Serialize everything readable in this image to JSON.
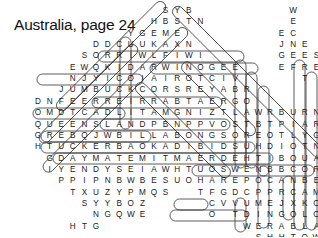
{
  "title": "Australia, page 24",
  "grid": {
    "x0": 38,
    "y0": 10,
    "dx": 11.6,
    "dy": 11.35,
    "rows": [
      {
        "r": 0,
        "c": 11,
        "letters": "SYB"
      },
      {
        "r": 1,
        "c": 10,
        "letters": "HBSTN"
      },
      {
        "r": 2,
        "c": 8,
        "letters": "YGEME"
      },
      {
        "r": 3,
        "c": 5,
        "letters": "DDCUUKAXN"
      },
      {
        "r": 4,
        "c": 4,
        "letters": "SORRIWLFIWI"
      },
      {
        "r": 5,
        "c": 3,
        "letters": "EWQKIDARWINOGEE"
      },
      {
        "r": 6,
        "c": 3,
        "letters": "NJYICOIAIROTCIV"
      },
      {
        "r": 7,
        "c": 2,
        "letters": "JUMBUCKCORSREYABR"
      },
      {
        "r": 8,
        "c": 0,
        "letters": "DNFEERREIRRABTAERGO"
      },
      {
        "r": 9,
        "c": 0,
        "letters": "OMDTCADLITAMGNIZTLAWRBURN"
      },
      {
        "r": 10,
        "c": 0,
        "letters": "QUEENSLANDPBNPPVOSTBTPIARWE"
      },
      {
        "r": 11,
        "c": 0,
        "letters": "GREBQJWBILLABONGSOREOTLYGHP"
      },
      {
        "r": 12,
        "c": 0,
        "letters": "HTUCKERBAOKADIBIDSUHDIOTNANT"
      },
      {
        "r": 13,
        "c": 1,
        "letters": "GDAYMATEMITMAERDEHTIBOUALPY"
      },
      {
        "r": 14,
        "c": 1,
        "letters": "IYENDYSEIAWHTUOSWENBBCORECC"
      },
      {
        "r": 15,
        "c": 2,
        "letters": "PPIPNBWBESUOHAREPOCANBERRA"
      },
      {
        "r": 16,
        "c": 3,
        "letters": "TXUZYPMQS"
      },
      {
        "r": 16,
        "c": 14,
        "letters": "TFGDCPPRCAMIQY"
      },
      {
        "r": 17,
        "c": 4,
        "letters": "SYYBOZ"
      },
      {
        "r": 17,
        "c": 15,
        "letters": "CVVUMEJXKODK"
      },
      {
        "r": 18,
        "c": 5,
        "letters": "NGQWE"
      },
      {
        "r": 18,
        "c": 15,
        "letters": "O"
      },
      {
        "r": 18,
        "c": 17,
        "letters": "TDINGOLOE"
      },
      {
        "r": 19,
        "c": 3,
        "letters": "HTG"
      },
      {
        "r": 19,
        "c": 18,
        "letters": "WERABLABR"
      },
      {
        "r": 20,
        "c": 19,
        "letters": "SHHTOWQ"
      },
      {
        "r": 21,
        "c": 19,
        "letters": "SXCPE"
      },
      {
        "r": 0,
        "c": 22,
        "letters": "W"
      }
    ],
    "columns": [
      {
        "c": 22,
        "r": 1,
        "letters": "ECNEF"
      },
      {
        "c": 21,
        "r": 2,
        "letters": "EJGE"
      },
      {
        "c": 23,
        "r": 3,
        "letters": "EERT"
      },
      {
        "c": 24,
        "r": 4,
        "letters": "SE"
      }
    ]
  },
  "found_words": [
    "DARWIN",
    "JUMBUCK",
    "QUEENSLAND",
    "TUCKERBAG",
    "GDAYMATE",
    "YENDYS",
    "BILLABONG",
    "CANBERRA",
    "DINGO",
    "EMU",
    "CROCODILE",
    "ADELAIDE",
    "PERTH",
    "SCISSOR",
    "FENCE",
    "EERTHASSURA",
    "AUSSIE",
    "KOALA",
    "WOMBAT",
    "GHOST"
  ]
}
